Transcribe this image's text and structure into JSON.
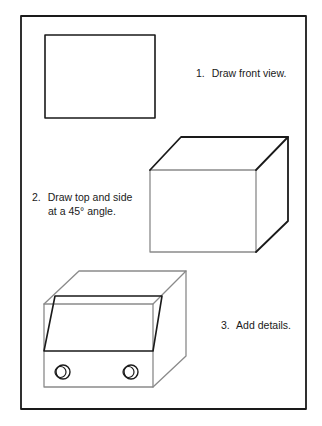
{
  "steps": [
    {
      "number": "1.",
      "text": "Draw front view."
    },
    {
      "number": "2.",
      "line1": "Draw top and side",
      "line2": "at a 45° angle."
    },
    {
      "number": "3.",
      "text": "Add details."
    }
  ],
  "colors": {
    "outline_dark": "#1a1a1a",
    "outline_light": "#8a8a8a",
    "background": "#ffffff"
  }
}
